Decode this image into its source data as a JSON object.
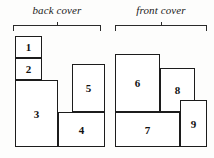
{
  "figure": {
    "background_color": "#fdfdfc",
    "line_color": "#1c1c1c"
  },
  "labels": [
    {
      "name": "back-cover",
      "text": "back cover",
      "x": 13,
      "y": 4,
      "width": 88
    },
    {
      "name": "front-cover",
      "text": "front cover",
      "x": 115,
      "y": 4,
      "width": 92
    }
  ],
  "brackets": [
    {
      "name": "back-cover-bracket",
      "x": 13,
      "y": 25,
      "width": 88
    },
    {
      "name": "front-cover-bracket",
      "x": 115,
      "y": 25,
      "width": 92
    }
  ],
  "boxes": [
    {
      "label": "1",
      "group": "back cover",
      "x": 15,
      "y": 36,
      "width": 27,
      "height": 22
    },
    {
      "label": "2",
      "group": "back cover",
      "x": 15,
      "y": 58,
      "width": 27,
      "height": 22
    },
    {
      "label": "3",
      "group": "back cover",
      "x": 15,
      "y": 80,
      "width": 43,
      "height": 67
    },
    {
      "label": "5",
      "group": "back cover",
      "x": 72,
      "y": 64,
      "width": 33,
      "height": 48
    },
    {
      "label": "4",
      "group": "back cover",
      "x": 58,
      "y": 112,
      "width": 47,
      "height": 35
    },
    {
      "label": "6",
      "group": "front cover",
      "x": 115,
      "y": 54,
      "width": 45,
      "height": 58
    },
    {
      "label": "8",
      "group": "front cover",
      "x": 160,
      "y": 68,
      "width": 35,
      "height": 44
    },
    {
      "label": "7",
      "group": "front cover",
      "x": 115,
      "y": 112,
      "width": 65,
      "height": 35
    },
    {
      "label": "9",
      "group": "front cover",
      "x": 180,
      "y": 100,
      "width": 27,
      "height": 47
    }
  ]
}
